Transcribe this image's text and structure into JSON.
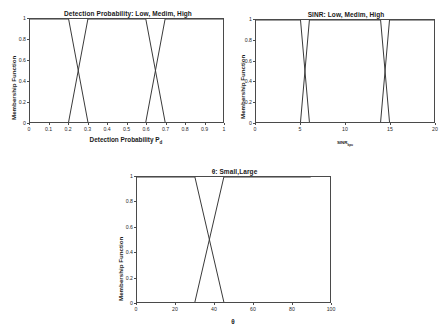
{
  "figure": {
    "background": "#ffffff",
    "line_color": "#3a3a3a",
    "axis_color": "#4a4a4a"
  },
  "chart_data": [
    {
      "type": "line",
      "id": "detection-probability",
      "title": "Detection Probability: Low, Medim, High",
      "xlabel": "Detection Probability P",
      "xlabel_sub": "d",
      "ylabel": "Membership Function",
      "xlim": [
        0,
        1
      ],
      "ylim": [
        0,
        1
      ],
      "grid": false,
      "legend": "none",
      "xticks": [
        "0",
        "0.1",
        "0.2",
        "0.3",
        "0.4",
        "0.5",
        "0.6",
        "0.7",
        "0.8",
        "0.9",
        "1"
      ],
      "xtick_values": [
        0,
        0.1,
        0.2,
        0.3,
        0.4,
        0.5,
        0.6,
        0.7,
        0.8,
        0.9,
        1
      ],
      "yticks": [
        "0",
        "0.2",
        "0.4",
        "0.6",
        "0.8",
        "1"
      ],
      "ytick_values": [
        0,
        0.2,
        0.4,
        0.6,
        0.8,
        1
      ],
      "series": [
        {
          "name": "Low",
          "x": [
            0,
            0.2,
            0.3
          ],
          "values": [
            1,
            1,
            0
          ]
        },
        {
          "name": "Medim",
          "x": [
            0.2,
            0.3,
            0.6,
            0.7
          ],
          "values": [
            0,
            1,
            1,
            0
          ]
        },
        {
          "name": "High",
          "x": [
            0.6,
            0.7,
            1
          ],
          "values": [
            0,
            1,
            1
          ]
        }
      ]
    },
    {
      "type": "line",
      "id": "sinr",
      "title": "SINR: Low, Medim, High",
      "xlabel": "SINR",
      "xlabel_sub": "kpu",
      "ylabel": "Membership Function",
      "xlim": [
        0,
        20
      ],
      "ylim": [
        0,
        1
      ],
      "grid": false,
      "legend": "none",
      "xticks": [
        "0",
        "5",
        "10",
        "15",
        "20"
      ],
      "xtick_values": [
        0,
        5,
        10,
        15,
        20
      ],
      "yticks": [
        "0",
        "0.2",
        "0.4",
        "0.6",
        "0.8",
        "1"
      ],
      "ytick_values": [
        0,
        0.2,
        0.4,
        0.6,
        0.8,
        1
      ],
      "series": [
        {
          "name": "Low",
          "x": [
            0,
            5,
            6
          ],
          "values": [
            1,
            1,
            0
          ]
        },
        {
          "name": "Medim",
          "x": [
            5,
            6,
            14,
            15
          ],
          "values": [
            0,
            1,
            1,
            0
          ]
        },
        {
          "name": "High",
          "x": [
            14,
            15,
            20
          ],
          "values": [
            0,
            1,
            1
          ]
        }
      ]
    },
    {
      "type": "line",
      "id": "theta",
      "title": "θ: Small,Large",
      "xlabel": "θ",
      "xlabel_sub": "",
      "ylabel": "Membership Function",
      "xlim": [
        0,
        100
      ],
      "ylim": [
        0,
        1
      ],
      "grid": false,
      "legend": "none",
      "xticks": [
        "0",
        "20",
        "40",
        "60",
        "80",
        "100"
      ],
      "xtick_values": [
        0,
        20,
        40,
        60,
        80,
        100
      ],
      "yticks": [
        "0",
        "0.2",
        "0.4",
        "0.6",
        "0.8",
        "1"
      ],
      "ytick_values": [
        0,
        0.2,
        0.4,
        0.6,
        0.8,
        1
      ],
      "series": [
        {
          "name": "Small",
          "x": [
            0,
            30,
            45
          ],
          "values": [
            1,
            1,
            0
          ]
        },
        {
          "name": "Large",
          "x": [
            30,
            45,
            90
          ],
          "values": [
            0,
            1,
            1
          ]
        }
      ]
    }
  ]
}
